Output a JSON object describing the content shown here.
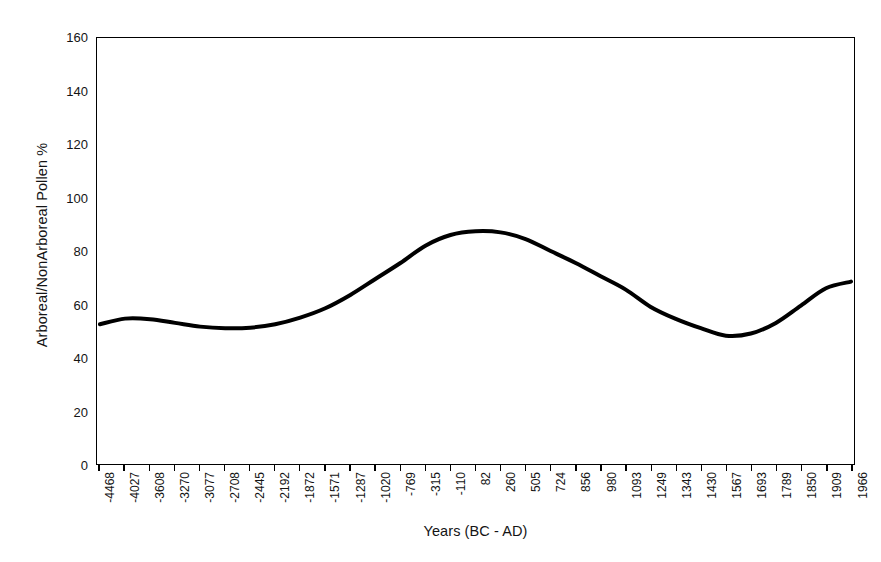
{
  "chart_data": {
    "type": "line",
    "title": "",
    "xlabel": "Years (BC - AD)",
    "ylabel": "Arboreal/NonArboreal Pollen %",
    "ylim": [
      0,
      160
    ],
    "ytick_step": 20,
    "yticks": [
      0,
      20,
      40,
      60,
      80,
      100,
      120,
      140,
      160
    ],
    "grid": false,
    "legend": "none",
    "line_color": "#000000",
    "line_width": 4,
    "categories": [
      "-4468",
      "-4027",
      "-3608",
      "-3270",
      "-3077",
      "-2708",
      "-2445",
      "-2192",
      "-1872",
      "-1571",
      "-1287",
      "-1020",
      "-769",
      "-315",
      "-110",
      "82",
      "260",
      "505",
      "724",
      "856",
      "980",
      "1093",
      "1249",
      "1343",
      "1430",
      "1567",
      "1693",
      "1789",
      "1850",
      "1909",
      "1966"
    ],
    "series": [
      {
        "name": "Arboreal/NonArboreal Pollen %",
        "values": [
          52.5,
          54.6,
          54.4,
          53.0,
          51.6,
          51.0,
          51.2,
          52.5,
          55.0,
          58.5,
          63.5,
          69.5,
          75.5,
          82.0,
          86.0,
          87.4,
          87.0,
          84.5,
          80.0,
          75.5,
          70.5,
          65.5,
          59.0,
          54.5,
          51.0,
          48.2,
          49.0,
          53.0,
          59.5,
          66.0,
          68.5
        ]
      }
    ],
    "annotations": {
      "peak_value": 87.4,
      "peak_category": "82",
      "trough_value": 48.2,
      "trough_category": "1567",
      "start_value": 52.5,
      "end_value": 68.5
    }
  }
}
